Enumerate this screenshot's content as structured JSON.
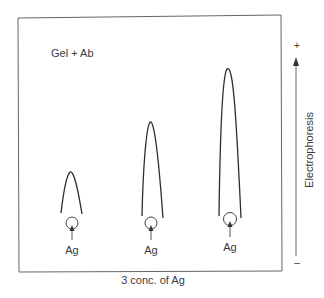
{
  "diagram": {
    "title": "Gel + Ab",
    "bottom_label": "3 conc. of Ag",
    "side_label": "Electrophoresis",
    "polarity": {
      "top": "+",
      "bottom": "–"
    },
    "colors": {
      "line": "#2e2e2e",
      "frame": "#555555",
      "text": "#3a3a3a"
    },
    "rockets": [
      {
        "well_label": "Ag",
        "concentration_rank": 1,
        "peak_height_rel": 1
      },
      {
        "well_label": "Ag",
        "concentration_rank": 2,
        "peak_height_rel": 2
      },
      {
        "well_label": "Ag",
        "concentration_rank": 3,
        "peak_height_rel": 3
      }
    ]
  }
}
